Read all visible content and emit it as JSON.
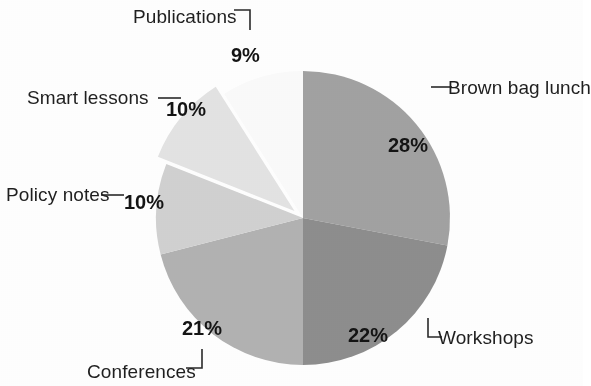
{
  "chart_data": {
    "type": "pie",
    "title": "",
    "subtitle": "",
    "xlabel": "",
    "ylabel": "",
    "legend_position": "none",
    "grid": false,
    "labels_on_slices": true,
    "start_angle_deg": 0,
    "direction": "clockwise",
    "categories": [
      "Brown bag lunch",
      "Workshops",
      "Conferences",
      "Policy notes",
      "Smart lessons",
      "Publications"
    ],
    "values": [
      28,
      22,
      21,
      10,
      10,
      9
    ],
    "value_labels": [
      "28%",
      "22%",
      "21%",
      "10%",
      "10%",
      "9%"
    ],
    "units": "percent",
    "total": 100,
    "colors": [
      "#a2a2a2",
      "#8e8e8e",
      "#b3b3b3",
      "#d2d2d2",
      "#e4e4e4",
      "#fbfbfb"
    ],
    "exploded_slices": [
      "Smart lessons"
    ],
    "slices": [
      {
        "name": "Brown bag lunch",
        "value": 28,
        "value_label": "28%",
        "color": "#a2a2a2",
        "exploded": false,
        "label_position": "outside-right",
        "leader": "dash"
      },
      {
        "name": "Workshops",
        "value": 22,
        "value_label": "22%",
        "color": "#8e8e8e",
        "exploded": false,
        "label_position": "outside-right",
        "leader": "corner-bottom-left"
      },
      {
        "name": "Conferences",
        "value": 21,
        "value_label": "21%",
        "color": "#b3b3b3",
        "exploded": false,
        "label_position": "outside-bottom",
        "leader": "corner-bottom-right"
      },
      {
        "name": "Policy notes",
        "value": 10,
        "value_label": "10%",
        "color": "#d2d2d2",
        "exploded": false,
        "label_position": "outside-left",
        "leader": "dash"
      },
      {
        "name": "Smart lessons",
        "value": 10,
        "value_label": "10%",
        "color": "#e4e4e4",
        "exploded": true,
        "label_position": "outside-left",
        "leader": "dash"
      },
      {
        "name": "Publications",
        "value": 9,
        "value_label": "9%",
        "color": "#fbfbfb",
        "exploded": false,
        "label_position": "outside-top",
        "leader": "corner-top-right"
      }
    ]
  },
  "labels": {
    "publications": "Publications",
    "smart_lessons": "Smart lessons",
    "policy_notes": "Policy notes",
    "conferences": "Conferences",
    "workshops": "Workshops",
    "brown_bag_lunch": "Brown bag lunch"
  },
  "values": {
    "publications": "9%",
    "smart_lessons": "10%",
    "policy_notes": "10%",
    "conferences": "21%",
    "workshops": "22%",
    "brown_bag_lunch": "28%"
  },
  "style": {
    "background": "#ffffff",
    "text_color": "#1f1f1f",
    "leader_color": "#2a2a2a"
  }
}
